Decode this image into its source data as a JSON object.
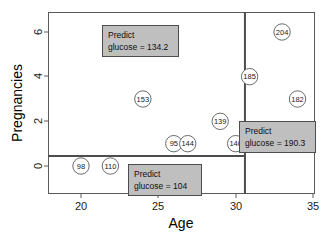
{
  "chart_data": {
    "type": "scatter",
    "title": "",
    "xlabel": "Age",
    "ylabel": "Pregnancies",
    "xlim": [
      17.9,
      32.9
    ],
    "ylim": [
      -1.4,
      6.9
    ],
    "xticks": [
      20,
      25,
      30,
      35
    ],
    "yticks": [
      0,
      2,
      4,
      6
    ],
    "grid": false,
    "legend": "none",
    "point_label_name": "glucose",
    "points": [
      {
        "label": "98",
        "x": 20.0,
        "y": 0.0
      },
      {
        "label": "110",
        "x": 21.9,
        "y": 0.0
      },
      {
        "label": "153",
        "x": 24.0,
        "y": 3.0
      },
      {
        "label": "95",
        "x": 26.0,
        "y": 1.0
      },
      {
        "label": "144",
        "x": 26.9,
        "y": 1.0
      },
      {
        "label": "139",
        "x": 29.0,
        "y": 2.0
      },
      {
        "label": "140",
        "x": 30.0,
        "y": 1.0
      },
      {
        "label": "185",
        "x": 30.9,
        "y": 4.0
      },
      {
        "label": "204",
        "x": 33.0,
        "y": 6.0
      },
      {
        "label": "182",
        "x": 34.0,
        "y": 3.0
      }
    ],
    "splits": [
      {
        "orientation": "horizontal",
        "value": 0.45,
        "x_from": 17.9,
        "x_to": 30.6
      },
      {
        "orientation": "vertical",
        "value": 30.6,
        "y_from": -1.4,
        "y_to": 6.9
      }
    ],
    "annotations": [
      {
        "id": "predict-upper-left",
        "line1": "Predict",
        "line2": "glucose = 134.2",
        "value": 134.2,
        "box_x": 102,
        "box_y": 25,
        "box_w": 76,
        "box_h": 31
      },
      {
        "id": "predict-right",
        "line1": "Predict",
        "line2": "glucose = 190.3",
        "value": 190.3,
        "box_x": 239,
        "box_y": 121,
        "box_w": 76,
        "box_h": 31
      },
      {
        "id": "predict-lower-left",
        "line1": "Predict",
        "line2": "glucose = 104",
        "value": 104,
        "box_x": 128,
        "box_y": 164,
        "box_w": 73,
        "box_h": 31
      }
    ],
    "colors": {
      "box_fill": "#bfbfbf",
      "box_stroke": "#4d4d4d",
      "point_stroke": "#6b6b6b",
      "axis": "#5a5a5a",
      "split": "#4d4d4d",
      "background": "#ffffff"
    }
  }
}
